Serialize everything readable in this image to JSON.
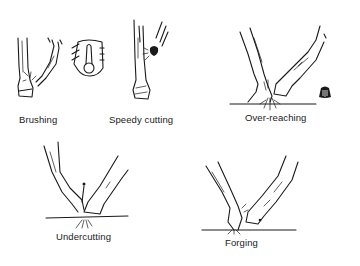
{
  "figure": {
    "panels": [
      {
        "id": "brushing",
        "label": "Brushing"
      },
      {
        "id": "brushing-boot",
        "label": ""
      },
      {
        "id": "speedy-cutting",
        "label": "Speedy cutting"
      },
      {
        "id": "over-reaching",
        "label": "Over-reaching"
      },
      {
        "id": "undercutting",
        "label": "Undercutting"
      },
      {
        "id": "forging",
        "label": "Forging"
      }
    ],
    "colors": {
      "ink": "#1a1a1a",
      "background": "#ffffff"
    }
  }
}
